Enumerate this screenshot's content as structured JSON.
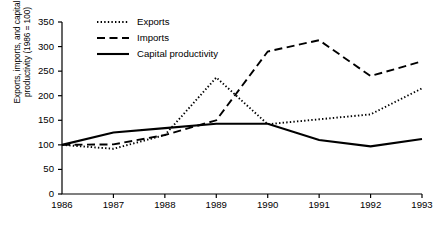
{
  "chart_data": {
    "type": "line",
    "title": "",
    "xlabel": "",
    "ylabel_line1": "Exports, imports, and capital",
    "ylabel_line2": "productivity (1986 = 100)",
    "categories": [
      "1986",
      "1987",
      "1988",
      "1989",
      "1990",
      "1991",
      "1992",
      "1993"
    ],
    "x": [
      1986,
      1987,
      1988,
      1989,
      1990,
      1991,
      1992,
      1993
    ],
    "xlim": [
      1986,
      1993
    ],
    "ylim": [
      0,
      350
    ],
    "yticks": [
      "0",
      "50",
      "100",
      "150",
      "200",
      "250",
      "300",
      "350"
    ],
    "ytick_values": [
      0,
      50,
      100,
      150,
      200,
      250,
      300,
      350
    ],
    "grid": false,
    "legend_position": "top-left",
    "series": [
      {
        "name": "Exports",
        "style": "dotted",
        "color": "#000000",
        "values": [
          100,
          92,
          120,
          237,
          142,
          152,
          162,
          215
        ]
      },
      {
        "name": "Imports",
        "style": "dashed",
        "color": "#000000",
        "values": [
          100,
          101,
          120,
          150,
          290,
          313,
          240,
          270
        ]
      },
      {
        "name": "Capital productivity",
        "style": "solid",
        "color": "#000000",
        "values": [
          100,
          125,
          134,
          143,
          143,
          110,
          97,
          112
        ]
      }
    ]
  },
  "legend": {
    "items": [
      {
        "label": "Exports",
        "style": "dotted"
      },
      {
        "label": "Imports",
        "style": "dashed"
      },
      {
        "label": "Capital productivity",
        "style": "solid"
      }
    ]
  },
  "colors": {
    "ink": "#000000",
    "background": "#ffffff"
  }
}
